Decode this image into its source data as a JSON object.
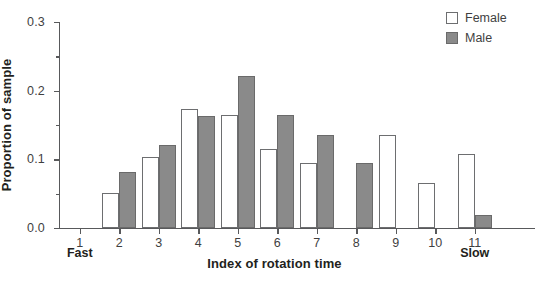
{
  "chart_data": {
    "type": "bar",
    "title": "",
    "xlabel": "Index of rotation time",
    "ylabel": "Proportion of sample",
    "categories": [
      "1",
      "2",
      "3",
      "4",
      "5",
      "6",
      "7",
      "8",
      "9",
      "10",
      "11"
    ],
    "series": [
      {
        "name": "Female",
        "color": "#ffffff",
        "values": [
          0,
          0.051,
          0.103,
          0.173,
          0.165,
          0.115,
          0.094,
          0,
          0.135,
          0.066,
          0.108
        ]
      },
      {
        "name": "Male",
        "color": "#8a8a8a",
        "values": [
          0,
          0.081,
          0.121,
          0.163,
          0.222,
          0.164,
          0.135,
          0.095,
          0,
          0,
          0.019
        ]
      }
    ],
    "ylim": [
      0,
      0.3
    ],
    "yticks": [
      0.0,
      0.1,
      0.2,
      0.3
    ],
    "ytick_labels": [
      "0.0",
      "0.1",
      "0.2",
      "0.3"
    ],
    "yminor_ticks": [
      0.05,
      0.15,
      0.25
    ],
    "grid": false,
    "legend_position": "top-right",
    "axis_end_labels": {
      "left": "Fast",
      "right": "Slow"
    }
  },
  "legend": {
    "items": [
      {
        "label": "Female"
      },
      {
        "label": "Male"
      }
    ]
  }
}
